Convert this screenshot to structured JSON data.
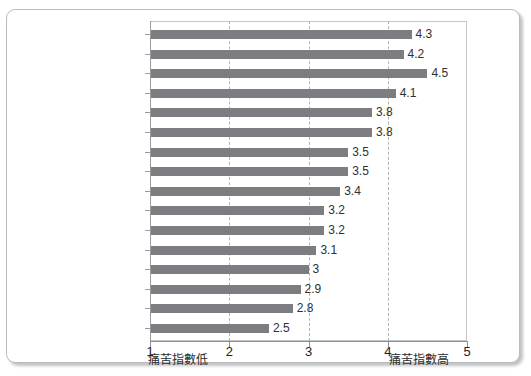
{
  "chart_data": {
    "type": "bar",
    "orientation": "horizontal",
    "title": "",
    "subtitle": "",
    "xlabel": "",
    "ylabel": "",
    "xlim": [
      1,
      5
    ],
    "x_ticks": [
      "1",
      "2",
      "3",
      "4",
      "5"
    ],
    "x_tick_values": [
      1,
      2,
      3,
      4,
      5
    ],
    "gridlines": {
      "vertical_dashed_at": [
        2,
        3,
        4
      ],
      "horizontal": false
    },
    "legend": {
      "visible": false,
      "position": "none"
    },
    "categories": [
      "",
      "",
      "",
      "",
      "",
      "",
      "",
      "",
      "",
      "",
      "",
      "",
      "",
      "",
      "",
      ""
    ],
    "values": [
      4.3,
      4.2,
      4.5,
      4.1,
      3.8,
      3.8,
      3.5,
      3.5,
      3.4,
      3.2,
      3.2,
      3.1,
      3,
      2.9,
      2.8,
      2.5
    ],
    "data_labels": [
      "4.3",
      "4.2",
      "4.5",
      "4.1",
      "3.8",
      "3.8",
      "3.5",
      "3.5",
      "3.4",
      "3.2",
      "3.2",
      "3.1",
      "3",
      "2.9",
      "2.8",
      "2.5"
    ],
    "bar_color": "#7b7d80",
    "annotations": [
      {
        "text": "痛苦指數低",
        "position": "below-axis-left"
      },
      {
        "text": "痛苦指數高",
        "position": "below-axis-right"
      }
    ]
  },
  "axis": {
    "low_caption": "痛苦指數低",
    "high_caption": "痛苦指數高"
  },
  "colors": {
    "bar": "#7b7d80",
    "gridline": "#b0b2b4",
    "axis": "#8e9092",
    "card_border": "#b9bbbd",
    "text": "#2f3031"
  }
}
